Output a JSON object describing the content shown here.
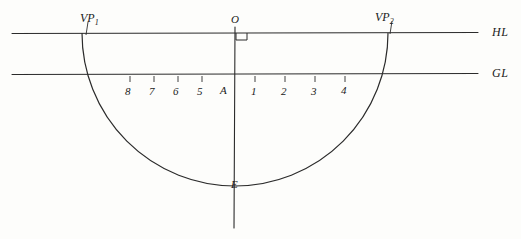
{
  "diagram": {
    "stroke_color": "#2b2b2b",
    "background": "#fdfdfb",
    "horizon_line": {
      "label": "HL",
      "label_full": "Horizon Line",
      "y": 33,
      "x_start": 12,
      "x_end": 478
    },
    "ground_line": {
      "label": "GL",
      "label_full": "Ground Line",
      "y": 74,
      "x_start": 12,
      "x_end": 478
    },
    "vertical_axis": {
      "label_top": "O",
      "label_bottom": "E",
      "x": 235,
      "y_top": 27,
      "y_bottom": 228
    },
    "right_angle_mark": {
      "name": "right-angle-marker",
      "x": 236,
      "y": 33
    },
    "vanishing_points": [
      {
        "id": "vp1",
        "label": "VP",
        "sub": "1",
        "x": 82,
        "y": 33
      },
      {
        "id": "vp2",
        "label": "VP",
        "sub": "2",
        "x": 388,
        "y": 33
      }
    ],
    "semicircle": {
      "center_x": 235,
      "center_y": 33,
      "radius": 153
    },
    "measuring_points": {
      "origin_label": "A",
      "origin_x": 224,
      "baseline_y": 90,
      "left_ticks": [
        {
          "label": "8",
          "x": 128
        },
        {
          "label": "7",
          "x": 152
        },
        {
          "label": "6",
          "x": 176
        },
        {
          "label": "5",
          "x": 200
        }
      ],
      "right_ticks": [
        {
          "label": "1",
          "x": 253
        },
        {
          "label": "2",
          "x": 283
        },
        {
          "label": "3",
          "x": 313
        },
        {
          "label": "4",
          "x": 343
        }
      ]
    }
  }
}
